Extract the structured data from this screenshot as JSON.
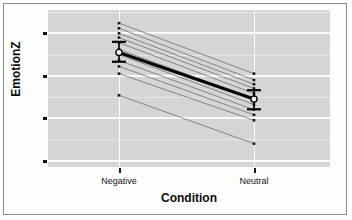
{
  "chart_data": {
    "type": "line",
    "title": "",
    "xlabel": "Condition",
    "ylabel": "EmotionZ",
    "categories": [
      "Negative",
      "Neutral"
    ],
    "x": [
      0,
      1
    ],
    "ylim": [
      -2.15,
      1.55
    ],
    "yticks": [
      1,
      0,
      -1,
      -2
    ],
    "ytick_labels": [
      "1",
      "0",
      "-1",
      "-2"
    ],
    "grid": true,
    "minor_grid": true,
    "legend": "none",
    "series": [
      {
        "name": "subject-1",
        "values": [
          1.24,
          0.05
        ]
      },
      {
        "name": "subject-2",
        "values": [
          1.12,
          -0.1
        ]
      },
      {
        "name": "subject-3",
        "values": [
          1.0,
          -0.2
        ]
      },
      {
        "name": "subject-4",
        "values": [
          0.9,
          -0.3
        ]
      },
      {
        "name": "subject-5",
        "values": [
          0.78,
          -0.42
        ]
      },
      {
        "name": "subject-6",
        "values": [
          0.62,
          -0.55
        ]
      },
      {
        "name": "subject-7",
        "values": [
          0.5,
          -0.68
        ]
      },
      {
        "name": "subject-8",
        "values": [
          0.36,
          -0.8
        ]
      },
      {
        "name": "subject-9",
        "values": [
          0.22,
          -0.92
        ]
      },
      {
        "name": "subject-10",
        "values": [
          0.05,
          -1.05
        ]
      },
      {
        "name": "subject-11",
        "values": [
          -0.46,
          -1.6
        ]
      }
    ],
    "mean_series": {
      "name": "mean",
      "values": [
        0.55,
        -0.55
      ],
      "error_upper": [
        0.8,
        -0.34
      ],
      "error_lower": [
        0.33,
        -0.79
      ]
    },
    "marker": "open-circle",
    "panel_background": "#d5d5d5",
    "gridline_color": "#fbfbfb",
    "mean_line_color": "#050505",
    "subject_line_color": "#5b5b5b"
  },
  "axes": {
    "y_title": "EmotionZ",
    "x_title": "Condition",
    "y_tick_labels": [
      "1",
      "0",
      "-1",
      "-2"
    ],
    "x_tick_labels": [
      "Negative",
      "Neutral"
    ]
  }
}
